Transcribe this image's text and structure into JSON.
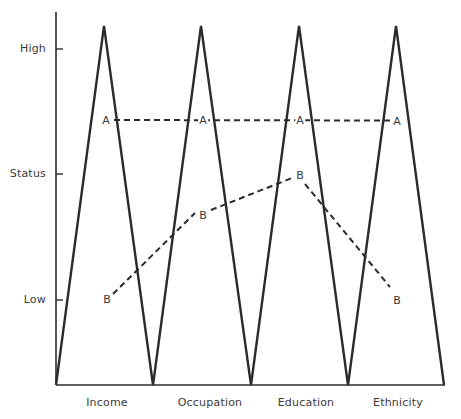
{
  "y_axis": {
    "label": "Status",
    "ticks": [
      {
        "label": "High",
        "y": 49
      },
      {
        "label": "Status",
        "y": 174
      },
      {
        "label": "Low",
        "y": 300
      }
    ]
  },
  "x_axis": {
    "categories": [
      {
        "label": "Income",
        "x": 107
      },
      {
        "label": "Occupation",
        "x": 210
      },
      {
        "label": "Education",
        "x": 306
      },
      {
        "label": "Ethnicity",
        "x": 398
      }
    ]
  },
  "profiles": [
    {
      "name": "A",
      "style": "dashed",
      "points": [
        {
          "category": "Income",
          "label": "A",
          "x": 106,
          "y": 120
        },
        {
          "category": "Occupation",
          "label": "A",
          "x": 203,
          "y": 120
        },
        {
          "category": "Education",
          "label": "A",
          "x": 300,
          "y": 120
        },
        {
          "category": "Ethnicity",
          "label": "A",
          "x": 397,
          "y": 121
        }
      ]
    },
    {
      "name": "B",
      "style": "dashed",
      "points": [
        {
          "category": "Income",
          "label": "B",
          "x": 107,
          "y": 299
        },
        {
          "category": "Occupation",
          "label": "B",
          "x": 203,
          "y": 215
        },
        {
          "category": "Education",
          "label": "B",
          "x": 300,
          "y": 175
        },
        {
          "category": "Ethnicity",
          "label": "B",
          "x": 397,
          "y": 300
        }
      ]
    }
  ],
  "zigzag": {
    "points": [
      [
        56,
        385
      ],
      [
        104,
        26
      ],
      [
        153,
        385
      ],
      [
        201,
        26
      ],
      [
        251,
        385
      ],
      [
        299,
        26
      ],
      [
        348,
        385
      ],
      [
        396,
        26
      ],
      [
        444,
        385
      ]
    ]
  },
  "colors": {
    "line": "#2b2b2b",
    "text": "#3a3a3a",
    "background": "#ffffff"
  }
}
